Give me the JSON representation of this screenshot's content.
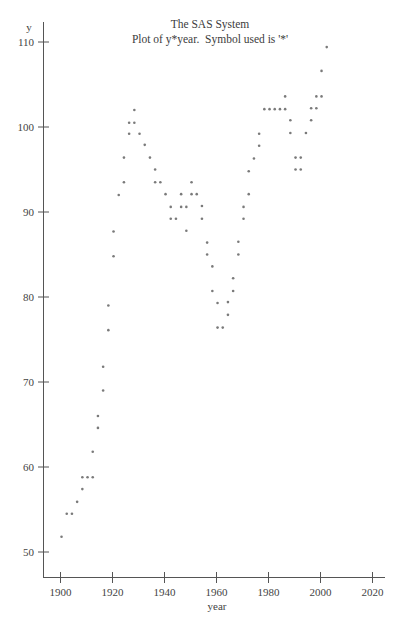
{
  "titles": {
    "line1": "The SAS System",
    "line2": "Plot of y*year.  Symbol used is '*'"
  },
  "chart_data": {
    "type": "scatter",
    "title": "The SAS System",
    "subtitle": "Plot of y*year.  Symbol used is '*'",
    "xlabel": "year",
    "ylabel": "y",
    "xlim": [
      1894,
      2024
    ],
    "ylim": [
      47,
      112
    ],
    "x_ticks": [
      1900,
      1920,
      1940,
      1960,
      1980,
      2000,
      2020
    ],
    "y_ticks": [
      50,
      60,
      70,
      80,
      90,
      100,
      110
    ],
    "grid": false,
    "legend": "none",
    "marker": "*",
    "points": [
      {
        "x": 1900,
        "y": 51.8
      },
      {
        "x": 1902,
        "y": 54.5
      },
      {
        "x": 1904,
        "y": 54.5
      },
      {
        "x": 1906,
        "y": 55.9
      },
      {
        "x": 1908,
        "y": 57.4
      },
      {
        "x": 1908,
        "y": 58.8
      },
      {
        "x": 1910,
        "y": 58.8
      },
      {
        "x": 1912,
        "y": 58.8
      },
      {
        "x": 1912,
        "y": 61.8
      },
      {
        "x": 1914,
        "y": 64.6
      },
      {
        "x": 1914,
        "y": 66.0
      },
      {
        "x": 1916,
        "y": 69.0
      },
      {
        "x": 1916,
        "y": 71.8
      },
      {
        "x": 1918,
        "y": 76.1
      },
      {
        "x": 1918,
        "y": 79.0
      },
      {
        "x": 1920,
        "y": 84.8
      },
      {
        "x": 1920,
        "y": 87.7
      },
      {
        "x": 1922,
        "y": 92.0
      },
      {
        "x": 1924,
        "y": 93.5
      },
      {
        "x": 1924,
        "y": 96.4
      },
      {
        "x": 1926,
        "y": 99.2
      },
      {
        "x": 1926,
        "y": 100.5
      },
      {
        "x": 1928,
        "y": 100.5
      },
      {
        "x": 1928,
        "y": 102.0
      },
      {
        "x": 1930,
        "y": 99.2
      },
      {
        "x": 1932,
        "y": 97.9
      },
      {
        "x": 1934,
        "y": 96.4
      },
      {
        "x": 1936,
        "y": 95.0
      },
      {
        "x": 1936,
        "y": 93.5
      },
      {
        "x": 1938,
        "y": 93.5
      },
      {
        "x": 1940,
        "y": 92.1
      },
      {
        "x": 1942,
        "y": 90.6
      },
      {
        "x": 1942,
        "y": 89.2
      },
      {
        "x": 1944,
        "y": 89.2
      },
      {
        "x": 1946,
        "y": 92.1
      },
      {
        "x": 1946,
        "y": 90.6
      },
      {
        "x": 1948,
        "y": 90.6
      },
      {
        "x": 1948,
        "y": 87.8
      },
      {
        "x": 1950,
        "y": 93.5
      },
      {
        "x": 1950,
        "y": 92.1
      },
      {
        "x": 1952,
        "y": 92.1
      },
      {
        "x": 1954,
        "y": 90.7
      },
      {
        "x": 1954,
        "y": 89.2
      },
      {
        "x": 1956,
        "y": 86.4
      },
      {
        "x": 1956,
        "y": 85.0
      },
      {
        "x": 1958,
        "y": 83.6
      },
      {
        "x": 1958,
        "y": 80.7
      },
      {
        "x": 1960,
        "y": 79.3
      },
      {
        "x": 1960,
        "y": 76.4
      },
      {
        "x": 1962,
        "y": 76.4
      },
      {
        "x": 1964,
        "y": 79.4
      },
      {
        "x": 1964,
        "y": 77.9
      },
      {
        "x": 1966,
        "y": 82.2
      },
      {
        "x": 1966,
        "y": 80.7
      },
      {
        "x": 1968,
        "y": 86.5
      },
      {
        "x": 1968,
        "y": 85.0
      },
      {
        "x": 1970,
        "y": 90.6
      },
      {
        "x": 1970,
        "y": 89.2
      },
      {
        "x": 1972,
        "y": 94.8
      },
      {
        "x": 1972,
        "y": 92.1
      },
      {
        "x": 1974,
        "y": 96.3
      },
      {
        "x": 1976,
        "y": 99.2
      },
      {
        "x": 1976,
        "y": 97.8
      },
      {
        "x": 1978,
        "y": 102.1
      },
      {
        "x": 1980,
        "y": 102.1
      },
      {
        "x": 1982,
        "y": 102.1
      },
      {
        "x": 1984,
        "y": 102.1
      },
      {
        "x": 1986,
        "y": 103.6
      },
      {
        "x": 1986,
        "y": 102.1
      },
      {
        "x": 1988,
        "y": 100.8
      },
      {
        "x": 1988,
        "y": 99.3
      },
      {
        "x": 1990,
        "y": 96.4
      },
      {
        "x": 1990,
        "y": 95.0
      },
      {
        "x": 1992,
        "y": 96.4
      },
      {
        "x": 1992,
        "y": 95.0
      },
      {
        "x": 1994,
        "y": 99.3
      },
      {
        "x": 1996,
        "y": 102.2
      },
      {
        "x": 1996,
        "y": 100.8
      },
      {
        "x": 1998,
        "y": 103.6
      },
      {
        "x": 1998,
        "y": 102.2
      },
      {
        "x": 2000,
        "y": 103.6
      },
      {
        "x": 2000,
        "y": 106.6
      },
      {
        "x": 2002,
        "y": 109.4
      }
    ]
  }
}
